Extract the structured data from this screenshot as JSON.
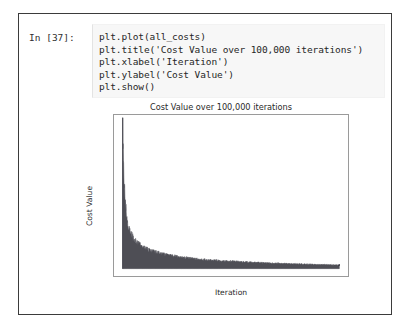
{
  "notebook": {
    "prompt_label": "In [37]:",
    "code_lines": [
      "plt.plot(all_costs)",
      "plt.title('Cost Value over 100,000 iterations')",
      "plt.xlabel('Iteration')",
      "plt.ylabel('Cost Value')",
      "plt.show()"
    ]
  },
  "colors": {
    "curve": "#4e4e55",
    "axis": "#9a9a9a",
    "text": "#2a2a2a",
    "cell_background": "#f7f7f7",
    "frame_border": "#3b3b3b"
  },
  "chart_data": {
    "type": "line",
    "title": "Cost Value over 100,000 iterations",
    "xlabel": "Iteration",
    "ylabel": "Cost Value",
    "xlim": [
      -4000,
      104000
    ],
    "ylim": [
      -0.022,
      0.46
    ],
    "xticks": [
      0,
      20000,
      40000,
      60000,
      80000,
      100000
    ],
    "xticklabels": [
      "0",
      "20000",
      "40000",
      "60000",
      "80000",
      "100000"
    ],
    "yticks": [
      0.0,
      0.1,
      0.2,
      0.3,
      0.4
    ],
    "yticklabels": [
      "0.0",
      "0.1",
      "0.2",
      "0.3",
      "0.4"
    ],
    "grid": false,
    "legend": null,
    "series": [
      {
        "name": "all_costs",
        "description": "Noisy monotonically decaying cost curve; dense high-frequency oscillation forms a filled band between an upper envelope and a lower envelope.",
        "x": [
          0,
          500,
          1000,
          1500,
          2000,
          2500,
          3000,
          4000,
          5000,
          6000,
          7000,
          8000,
          9000,
          10000,
          12000,
          14000,
          16000,
          18000,
          20000,
          25000,
          30000,
          35000,
          40000,
          45000,
          50000,
          55000,
          60000,
          65000,
          70000,
          75000,
          80000,
          85000,
          90000,
          95000,
          100000
        ],
        "upper": [
          0.452,
          0.334,
          0.242,
          0.196,
          0.168,
          0.148,
          0.134,
          0.114,
          0.101,
          0.092,
          0.085,
          0.079,
          0.074,
          0.07,
          0.063,
          0.058,
          0.054,
          0.05,
          0.047,
          0.041,
          0.036,
          0.032,
          0.029,
          0.027,
          0.025,
          0.023,
          0.021,
          0.02,
          0.018,
          0.017,
          0.016,
          0.015,
          0.014,
          0.013,
          0.012
        ],
        "lower": [
          0.0,
          0.0,
          0.0,
          0.0,
          0.0,
          0.0,
          0.0,
          0.0,
          0.0,
          0.0,
          0.0,
          0.0,
          0.0,
          0.0,
          0.0,
          0.0,
          0.0,
          0.0,
          0.0,
          0.0,
          0.0,
          0.0,
          0.0,
          0.0,
          0.0,
          0.0,
          0.0,
          0.0,
          0.0,
          0.0,
          0.0,
          0.0,
          0.0,
          0.0,
          0.0
        ]
      }
    ]
  }
}
